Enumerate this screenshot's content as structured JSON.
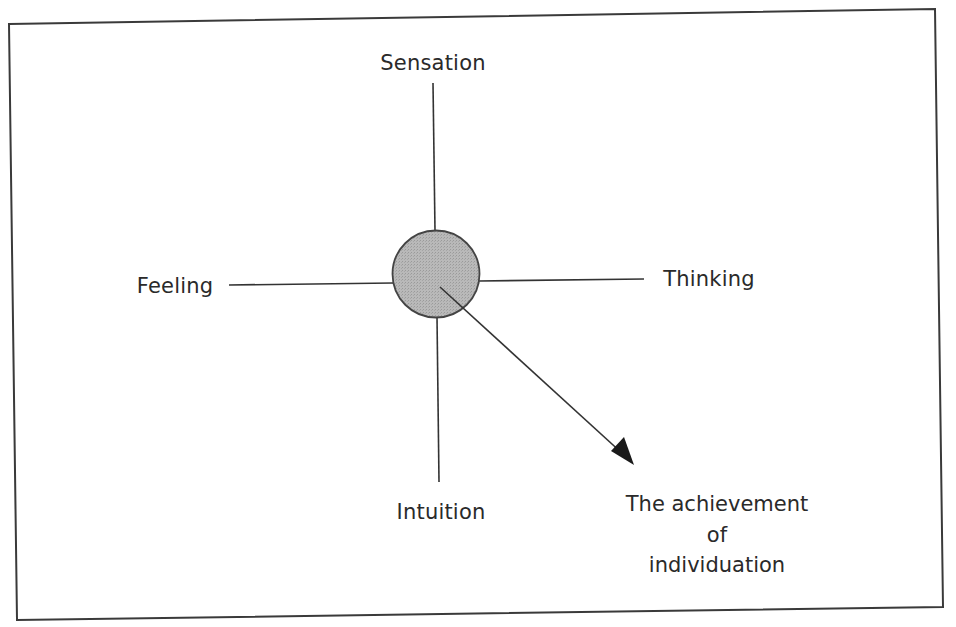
{
  "diagram": {
    "type": "function-compass",
    "center": {
      "label": "",
      "fill": "#b4b4b4",
      "stroke": "#444444"
    },
    "axes": {
      "top": "Sensation",
      "left": "Feeling",
      "right": "Thinking",
      "bottom": "Intuition"
    },
    "arrow": {
      "target_lines": [
        "The achievement",
        "of",
        "individuation"
      ]
    },
    "frame_color": "#3a3a3a",
    "line_color": "#333333"
  }
}
